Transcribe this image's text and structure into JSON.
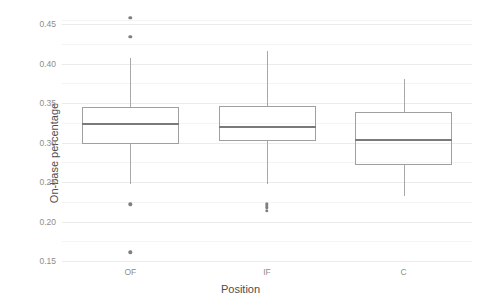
{
  "chart_data": {
    "type": "box",
    "title": "",
    "xlabel": "Position",
    "ylabel": "On-base percentage",
    "categories": [
      "OF",
      "IF",
      "C"
    ],
    "ylim": [
      0.145,
      0.468
    ],
    "yticks": [
      0.15,
      0.2,
      0.25,
      0.3,
      0.35,
      0.4,
      0.45
    ],
    "ytick_labels": [
      "0.15",
      "0.20",
      "0.25",
      "0.30",
      "0.35",
      "0.40",
      "0.45"
    ],
    "minor_gridlines": [
      0.175,
      0.225,
      0.275,
      0.325,
      0.375,
      0.425,
      0.455
    ],
    "grid": true,
    "legend": "none",
    "boxes": [
      {
        "category": "OF",
        "lower_whisker": 0.248,
        "q1": 0.298,
        "median": 0.324,
        "q3": 0.345,
        "upper_whisker": 0.407,
        "outliers": [
          0.458,
          0.434,
          0.222,
          0.161
        ]
      },
      {
        "category": "IF",
        "lower_whisker": 0.247,
        "q1": 0.302,
        "median": 0.32,
        "q3": 0.346,
        "upper_whisker": 0.416,
        "outliers": [
          0.222,
          0.218,
          0.214
        ]
      },
      {
        "category": "C",
        "lower_whisker": 0.232,
        "q1": 0.272,
        "median": 0.304,
        "q3": 0.339,
        "upper_whisker": 0.381,
        "outliers": []
      }
    ],
    "colors": {
      "box_border": "#a0a0a0",
      "median": "#7a7a7a",
      "whisker": "#a8a8a8",
      "outlier": "#7f7f7f",
      "grid_major": "#ebebeb",
      "grid_minor": "#f4f4f4",
      "panel_background": "#ffffff",
      "tick_text": "#8d8d8d",
      "axis_title_text": "#4d4d4d"
    }
  }
}
